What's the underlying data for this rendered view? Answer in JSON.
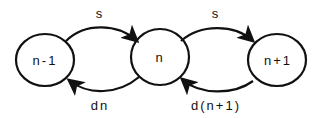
{
  "diagram": {
    "nodes": [
      {
        "id": "n_minus_1",
        "label": "n-1",
        "cx": 45,
        "cy": 60
      },
      {
        "id": "n",
        "label": "n",
        "cx": 160,
        "cy": 57
      },
      {
        "id": "n_plus_1",
        "label": "n+1",
        "cx": 277,
        "cy": 60
      }
    ],
    "edges": [
      {
        "from": "n-1",
        "to": "n",
        "label": "s"
      },
      {
        "from": "n",
        "to": "n-1",
        "label": "dn"
      },
      {
        "from": "n",
        "to": "n+1",
        "label": "s"
      },
      {
        "from": "n+1",
        "to": "n",
        "label": "d(n+1)"
      }
    ],
    "stroke_color": "#111111"
  }
}
